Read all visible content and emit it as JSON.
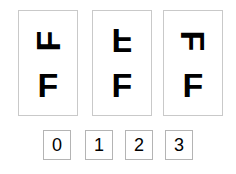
{
  "stimulus": {
    "cards": [
      {
        "name": "card-0",
        "top_glyph": {
          "character": "F",
          "orientation": "rotated-90-counterclockwise",
          "icon": "rotated-f-icon"
        },
        "bottom_glyph": {
          "character": "F",
          "orientation": "upright",
          "icon": "upright-f-icon"
        }
      },
      {
        "name": "card-1",
        "top_glyph": {
          "character": "F",
          "orientation": "flipped-vertical",
          "icon": "rotated-f-icon"
        },
        "bottom_glyph": {
          "character": "F",
          "orientation": "upright",
          "icon": "upright-f-icon"
        }
      },
      {
        "name": "card-2",
        "top_glyph": {
          "character": "F",
          "orientation": "rotated-90-clockwise",
          "icon": "rotated-f-icon"
        },
        "bottom_glyph": {
          "character": "F",
          "orientation": "upright",
          "icon": "upright-f-icon"
        }
      }
    ]
  },
  "options": {
    "items": [
      {
        "label": "0",
        "value": 0
      },
      {
        "label": "1",
        "value": 1
      },
      {
        "label": "2",
        "value": 2
      },
      {
        "label": "3",
        "value": 3
      }
    ]
  },
  "colors": {
    "background": "#ffffff",
    "card_border": "#c9c9c9",
    "option_border": "#b4b4b4",
    "glyph": "#000000"
  }
}
